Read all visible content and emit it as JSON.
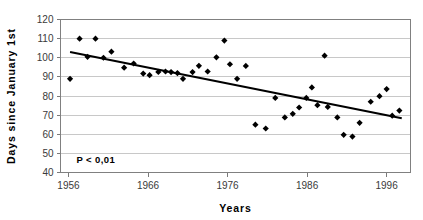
{
  "chart_data": {
    "type": "scatter",
    "title": "",
    "xlabel": "Years",
    "ylabel": "Days since January 1st",
    "xlim": [
      1955,
      1999
    ],
    "ylim": [
      40,
      120
    ],
    "xticks": [
      1956,
      1966,
      1976,
      1986,
      1996
    ],
    "yticks": [
      40,
      50,
      60,
      70,
      80,
      90,
      100,
      110,
      120
    ],
    "grid": "horizontal",
    "legend": "none",
    "annotations": [
      {
        "text": "P < 0,01",
        "x": 1957,
        "y": 45
      }
    ],
    "series": [
      {
        "name": "Observations",
        "marker": "diamond",
        "color": "#000000",
        "points": [
          {
            "x": 1956.2,
            "y": 89.0
          },
          {
            "x": 1957.4,
            "y": 110.0
          },
          {
            "x": 1958.4,
            "y": 100.5
          },
          {
            "x": 1959.4,
            "y": 110.0
          },
          {
            "x": 1960.4,
            "y": 100.0
          },
          {
            "x": 1961.4,
            "y": 103.2
          },
          {
            "x": 1963.0,
            "y": 94.8
          },
          {
            "x": 1964.2,
            "y": 97.0
          },
          {
            "x": 1965.4,
            "y": 91.7
          },
          {
            "x": 1966.2,
            "y": 90.9
          },
          {
            "x": 1967.3,
            "y": 92.6
          },
          {
            "x": 1968.2,
            "y": 92.8
          },
          {
            "x": 1968.9,
            "y": 92.5
          },
          {
            "x": 1969.7,
            "y": 92.0
          },
          {
            "x": 1970.4,
            "y": 89.0
          },
          {
            "x": 1971.6,
            "y": 92.5
          },
          {
            "x": 1972.4,
            "y": 95.8
          },
          {
            "x": 1973.5,
            "y": 92.8
          },
          {
            "x": 1974.6,
            "y": 100.2
          },
          {
            "x": 1975.6,
            "y": 109.0
          },
          {
            "x": 1976.3,
            "y": 96.6
          },
          {
            "x": 1977.2,
            "y": 89.0
          },
          {
            "x": 1978.3,
            "y": 95.7
          },
          {
            "x": 1979.5,
            "y": 65.0
          },
          {
            "x": 1980.8,
            "y": 63.0
          },
          {
            "x": 1982.0,
            "y": 79.0
          },
          {
            "x": 1983.2,
            "y": 68.8
          },
          {
            "x": 1984.2,
            "y": 70.7
          },
          {
            "x": 1985.0,
            "y": 74.0
          },
          {
            "x": 1985.9,
            "y": 79.0
          },
          {
            "x": 1986.6,
            "y": 84.5
          },
          {
            "x": 1987.3,
            "y": 75.2
          },
          {
            "x": 1988.2,
            "y": 101.1
          },
          {
            "x": 1988.6,
            "y": 74.3
          },
          {
            "x": 1989.8,
            "y": 68.8
          },
          {
            "x": 1990.6,
            "y": 59.7
          },
          {
            "x": 1991.7,
            "y": 58.8
          },
          {
            "x": 1992.6,
            "y": 66.0
          },
          {
            "x": 1994.0,
            "y": 77.0
          },
          {
            "x": 1995.1,
            "y": 79.9
          },
          {
            "x": 1996.0,
            "y": 83.6
          },
          {
            "x": 1996.7,
            "y": 69.7
          },
          {
            "x": 1997.6,
            "y": 72.4
          }
        ]
      }
    ],
    "trendline": {
      "name": "Linear trend",
      "color": "#000000",
      "x_start": 1956.2,
      "y_start": 103.0,
      "x_end": 1997.9,
      "y_end": 68.4
    }
  }
}
